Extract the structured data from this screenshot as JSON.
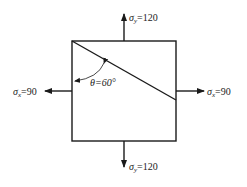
{
  "diagram": {
    "stresses": {
      "top": {
        "symbol": "σ",
        "sub": "y",
        "value": "=120"
      },
      "bottom": {
        "symbol": "σ",
        "sub": "y",
        "value": "=120"
      },
      "left": {
        "symbol": "σ",
        "sub": "x",
        "value": "=90"
      },
      "right": {
        "symbol": "σ",
        "sub": "x",
        "value": "=90"
      }
    },
    "angle": {
      "symbol": "θ",
      "value": "=60°"
    },
    "colors": {
      "stroke": "#1a1a1a",
      "background": "#ffffff"
    }
  }
}
